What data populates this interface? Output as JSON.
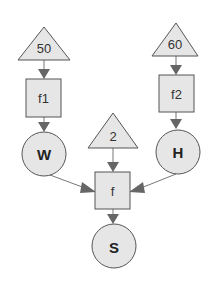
{
  "diagram": {
    "type": "flow",
    "colors": {
      "node_fill": "#e6e6e6",
      "node_stroke": "#555555",
      "edge": "#777777",
      "text": "#333333"
    },
    "nodes": {
      "const_50": {
        "shape": "triangle",
        "label": "50"
      },
      "const_60": {
        "shape": "triangle",
        "label": "60"
      },
      "const_2": {
        "shape": "triangle",
        "label": "2"
      },
      "func_f1": {
        "shape": "square",
        "label": "f1"
      },
      "func_f2": {
        "shape": "square",
        "label": "f2"
      },
      "func_f": {
        "shape": "square",
        "label": "f"
      },
      "var_W": {
        "shape": "circle",
        "label": "W"
      },
      "var_H": {
        "shape": "circle",
        "label": "H"
      },
      "var_S": {
        "shape": "circle",
        "label": "S"
      }
    },
    "edges": [
      {
        "from": "50",
        "to": "f1"
      },
      {
        "from": "f1",
        "to": "W"
      },
      {
        "from": "60",
        "to": "f2"
      },
      {
        "from": "f2",
        "to": "H"
      },
      {
        "from": "2",
        "to": "f"
      },
      {
        "from": "W",
        "to": "f"
      },
      {
        "from": "H",
        "to": "f"
      },
      {
        "from": "f",
        "to": "S"
      }
    ]
  }
}
